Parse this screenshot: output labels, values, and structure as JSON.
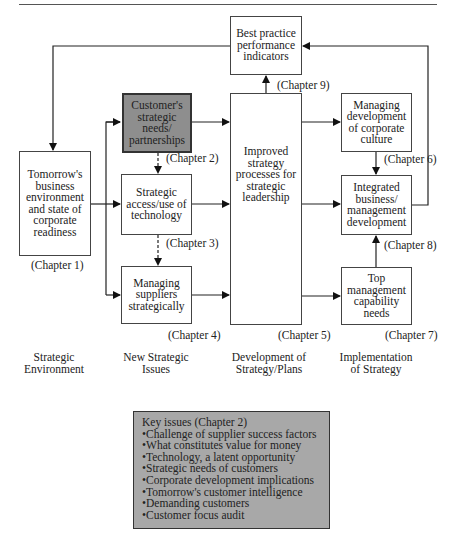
{
  "boxes": {
    "best_practice": "Best practice performance indicators",
    "customers": "Customer's strategic needs/ partnerships",
    "tomorrow": "Tomorrow's business environment and state of corporate readiness",
    "strategic_access": "Strategic access/use of technology",
    "managing_suppliers": "Managing suppliers strategically",
    "improved_strategy": "Improved strategy processes for strategic leadership",
    "managing_culture": "Managing development of corporate culture",
    "integrated": "Integrated business/ management development",
    "top_management": "Top management capability needs"
  },
  "chapters": {
    "c1": "(Chapter 1)",
    "c2": "(Chapter 2)",
    "c3": "(Chapter 3)",
    "c4": "(Chapter 4)",
    "c5": "(Chapter 5)",
    "c6": "(Chapter 6)",
    "c7": "(Chapter 7)",
    "c8": "(Chapter 8)",
    "c9": "(Chapter 9)"
  },
  "columns": {
    "env_1": "Strategic",
    "env_2": "Environment",
    "issues_1": "New Strategic",
    "issues_2": "Issues",
    "dev_1": "Development of",
    "dev_2": "Strategy/Plans",
    "impl_1": "Implementation",
    "impl_2": "of Strategy"
  },
  "key_issues": {
    "title": "Key issues (Chapter 2)",
    "items": [
      "Challenge of supplier success factors",
      "What constitutes value for money",
      "Technology, a latent opportunity",
      "Strategic needs of customers",
      "Corporate development implications",
      "Tomorrow's customer intelligence",
      "Demanding customers",
      "Customer focus audit"
    ]
  }
}
